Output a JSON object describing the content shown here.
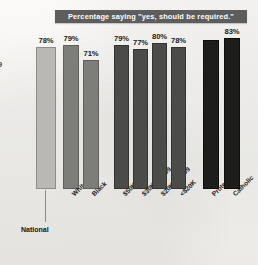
{
  "chart": {
    "title": "Percentage saying \"yes, should be required.\"",
    "title_bg": "#5d5d5d",
    "title_color": "#ffffff",
    "edge_glyph": "9",
    "national_caption": "National"
  },
  "chart_data": {
    "type": "bar",
    "title": "Percentage saying \"yes, should be required.\"",
    "xlabel": "",
    "ylabel": "",
    "ylim": [
      0,
      100
    ],
    "grid": false,
    "legend": "none",
    "orientation": "vertical",
    "value_suffix": "%",
    "categories": [
      "National",
      "White",
      "Black",
      "$50K+",
      "$30K-49,999",
      "$20K-29,999",
      "<$20K",
      "Protestant",
      "Catholic"
    ],
    "values": [
      78,
      79,
      71,
      79,
      77,
      80,
      78,
      82,
      83
    ],
    "labels_shown": [
      "78%",
      "79%",
      "71%",
      "79%",
      "77%",
      "80%",
      "78%",
      "",
      "83%"
    ],
    "groups": [
      {
        "name": "National",
        "shade": "#b9b8b4",
        "categories": [
          "National"
        ],
        "values": [
          78
        ]
      },
      {
        "name": "Race",
        "shade": "#7d7d7a",
        "categories": [
          "White",
          "Black"
        ],
        "values": [
          79,
          71
        ]
      },
      {
        "name": "Income",
        "shade": "#4b4b4a",
        "categories": [
          "$50K+",
          "$30K-49,999",
          "$20K-29,999",
          "<$20K"
        ],
        "values": [
          79,
          77,
          80,
          78
        ]
      },
      {
        "name": "Religion",
        "shade": "#1d1d1c",
        "categories": [
          "Protestant",
          "Catholic"
        ],
        "values": [
          82,
          83
        ]
      }
    ],
    "bars": [
      {
        "label": "National",
        "value": 78,
        "value_label": "78%",
        "shade_class": "sh-national",
        "x": 36,
        "w": 20,
        "rotated": false
      },
      {
        "label": "White",
        "value": 79,
        "value_label": "79%",
        "shade_class": "sh-race",
        "x": 63,
        "w": 16,
        "rotated": true
      },
      {
        "label": "Black",
        "value": 71,
        "value_label": "71%",
        "shade_class": "sh-race",
        "x": 83,
        "w": 16,
        "rotated": true
      },
      {
        "label": "$50K+",
        "value": 79,
        "value_label": "79%",
        "shade_class": "sh-income",
        "x": 114,
        "w": 15,
        "rotated": true
      },
      {
        "label": "$30K-49,999",
        "value": 77,
        "value_label": "77%",
        "shade_class": "sh-income",
        "x": 133,
        "w": 15,
        "rotated": true
      },
      {
        "label": "$20K-29,999",
        "value": 80,
        "value_label": "80%",
        "shade_class": "sh-income",
        "x": 152,
        "w": 15,
        "rotated": true
      },
      {
        "label": "<$20K",
        "value": 78,
        "value_label": "78%",
        "shade_class": "sh-income",
        "x": 171,
        "w": 15,
        "rotated": true
      },
      {
        "label": "Protestant",
        "value": 82,
        "value_label": "",
        "shade_class": "sh-relig",
        "x": 203,
        "w": 16,
        "rotated": true
      },
      {
        "label": "Catholic",
        "value": 83,
        "value_label": "83%",
        "shade_class": "sh-relig",
        "x": 224,
        "w": 16,
        "rotated": true
      }
    ]
  }
}
